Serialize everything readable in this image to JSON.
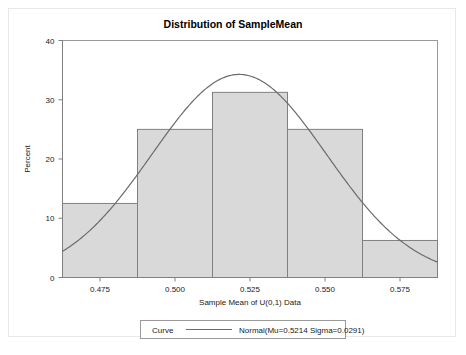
{
  "chart_data": {
    "type": "bar",
    "title": "Distribution of SampleMean",
    "xlabel": "Sample Mean of U(0,1) Data",
    "ylabel": "Percent",
    "xlim": [
      0.4625,
      0.5875
    ],
    "ylim": [
      0,
      40
    ],
    "xticks": [
      "0.475",
      "0.500",
      "0.525",
      "0.550",
      "0.575"
    ],
    "xtick_values": [
      0.475,
      0.5,
      0.525,
      0.55,
      0.575
    ],
    "yticks": [
      "0",
      "10",
      "20",
      "30",
      "40"
    ],
    "ytick_values": [
      0,
      10,
      20,
      30,
      40
    ],
    "grid": false,
    "bin_edges": [
      0.4625,
      0.4875,
      0.5125,
      0.5375,
      0.5625,
      0.5875
    ],
    "categories": [
      "0.4625-0.4875",
      "0.4875-0.5125",
      "0.5125-0.5375",
      "0.5375-0.5625",
      "0.5625-0.5875"
    ],
    "values": [
      12.5,
      25,
      31.25,
      25,
      6.25
    ],
    "bar_fill": "#d9d9d9",
    "bar_stroke": "#808080",
    "curve": {
      "name": "Normal(Mu=0.5214 Sigma=0.0291)",
      "distribution": "Normal",
      "mu": 0.5214,
      "sigma": 0.0291,
      "bin_width": 0.025,
      "color": "#6b6b6b",
      "peak_percent": 34.3
    },
    "legend": {
      "position": "bottom",
      "row_label": "Curve",
      "entries": [
        {
          "label": "Normal(Mu=0.5214 Sigma=0.0291)",
          "color": "#6b6b6b"
        }
      ]
    }
  },
  "plot": {
    "frame_color": "#9a9a9a",
    "axis_color": "#808080"
  }
}
